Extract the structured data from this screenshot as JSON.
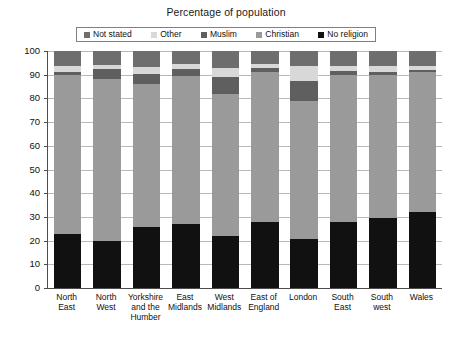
{
  "chart_data": {
    "type": "bar",
    "subtype": "stacked-column-100",
    "title": "Percentage of population",
    "xlabel": "",
    "ylabel": "",
    "ylim": [
      0,
      100
    ],
    "yticks": [
      0,
      10,
      20,
      30,
      40,
      50,
      60,
      70,
      80,
      90,
      100
    ],
    "ytick_labels": [
      "0",
      "10",
      "20",
      "30",
      "40",
      "50",
      "60",
      "70",
      "80",
      "90",
      "100"
    ],
    "grid": true,
    "legend_position": "top",
    "categories": [
      "North East",
      "North West",
      "Yorkshire and the Humber",
      "East Midlands",
      "West Midlands",
      "East of England",
      "London",
      "South East",
      "South west",
      "Wales"
    ],
    "stack_order_bottom_to_top": [
      "No religion",
      "Christian",
      "Muslim",
      "Other",
      "Not stated"
    ],
    "series": [
      {
        "name": "No religion",
        "color": "#111111",
        "values": [
          23.0,
          19.8,
          25.9,
          27.2,
          22.0,
          27.8,
          20.7,
          27.7,
          29.4,
          32.1
        ]
      },
      {
        "name": "Christian",
        "color": "#9a9a9a",
        "values": [
          67.0,
          68.2,
          60.1,
          62.3,
          60.0,
          63.2,
          58.3,
          62.3,
          60.6,
          58.9
        ]
      },
      {
        "name": "Muslim",
        "color": "#5f5f5f",
        "values": [
          1.2,
          4.5,
          4.2,
          3.0,
          7.0,
          1.9,
          8.5,
          1.7,
          1.3,
          1.1
        ]
      },
      {
        "name": "Other",
        "color": "#d8d8d8",
        "values": [
          2.3,
          1.5,
          3.1,
          2.0,
          4.0,
          1.6,
          6.0,
          2.0,
          2.2,
          1.4
        ]
      },
      {
        "name": "Not stated",
        "color": "#6e6e6e",
        "values": [
          6.5,
          6.0,
          6.7,
          5.5,
          7.0,
          5.5,
          6.5,
          6.3,
          6.5,
          6.5
        ]
      }
    ]
  },
  "legend": {
    "items": [
      {
        "label": "Not stated",
        "color": "#6e6e6e"
      },
      {
        "label": "Other",
        "color": "#d8d8d8"
      },
      {
        "label": "Muslim",
        "color": "#5f5f5f"
      },
      {
        "label": "Christian",
        "color": "#9a9a9a"
      },
      {
        "label": "No religion",
        "color": "#111111"
      }
    ]
  }
}
